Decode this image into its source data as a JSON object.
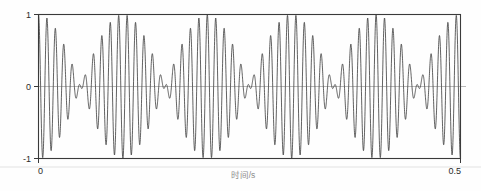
{
  "figure": {
    "background_color": "#fefefe",
    "line_color": "#2e2e2e",
    "axis_color": "#3a3a3a"
  },
  "axes": {
    "x_title": "时间/s",
    "y_title": "",
    "x_ticks": [
      "0",
      "0.5"
    ],
    "y_ticks": [
      "1",
      "0",
      "-1"
    ]
  },
  "chart_data": {
    "type": "line",
    "title": "",
    "xlabel": "时间/s",
    "ylabel": "",
    "xlim": [
      0,
      0.5
    ],
    "ylim": [
      -1,
      1
    ],
    "xticks": [
      0,
      0.5
    ],
    "xticklabels": [
      "0",
      "0.5"
    ],
    "yticks": [
      1,
      0,
      -1
    ],
    "yticklabels": [
      "1",
      "0",
      "-1"
    ],
    "grid": false,
    "legend": null,
    "series": [
      {
        "name": "beat signal",
        "color": "#2e2e2e",
        "formula": "y = cos(2*pi*f1*t) * cos(2*pi*f2*t)",
        "carrier_frequency_hz": 100,
        "envelope_frequency_hz": 5,
        "beat_frequency_hz": 10,
        "component_frequencies_hz": [
          95,
          105
        ],
        "amplitude": 1,
        "n_samples": 4000,
        "envelope_peak_times_s": [
          0.0,
          0.1,
          0.2,
          0.3,
          0.4,
          0.5
        ],
        "envelope_node_times_s": [
          0.05,
          0.15,
          0.25,
          0.35,
          0.45
        ]
      }
    ]
  }
}
